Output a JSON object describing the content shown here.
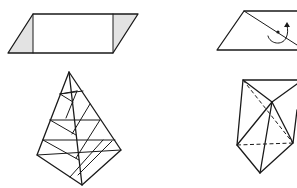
{
  "figure": {
    "colors": {
      "line": "#1a1a1a",
      "shading": "#e3e3e3",
      "background": "#ffffff"
    },
    "panels": [
      {
        "id": "parallelogram-dissection",
        "shaded_regions": 2,
        "has_labels": false
      },
      {
        "id": "parallelogram-rotation",
        "rotation_marker": "curved-arrow",
        "center_point": true
      },
      {
        "id": "pyramid-slicing",
        "horizontal_slices": 4
      },
      {
        "id": "polyhedron-tetrahedra",
        "dashed_hidden_edges": 2
      }
    ]
  }
}
